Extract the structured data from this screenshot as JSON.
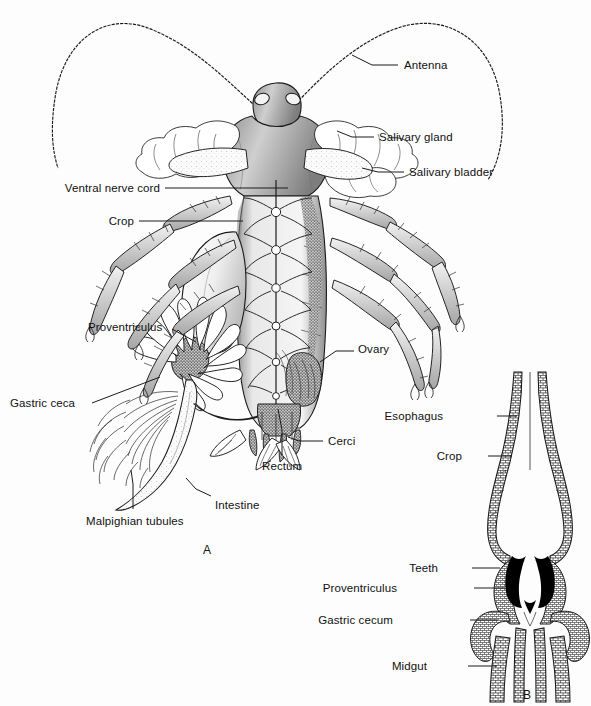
{
  "plate": {
    "background_color": "#fdfdfd",
    "ink_color": "#1a1a1a",
    "panels": [
      {
        "id": "A",
        "caption": "A",
        "x": 203,
        "y": 543
      },
      {
        "id": "B",
        "caption": "B",
        "x": 523,
        "y": 688
      }
    ]
  },
  "figure_a": {
    "name": "cockroach-internal-anatomy-dorsal-dissection",
    "labels": [
      {
        "key": "antenna",
        "text": "Antenna",
        "x": 404,
        "y": 60,
        "align": "left",
        "leader": [
          [
            398,
            65
          ],
          [
            372,
            65
          ],
          [
            352,
            55
          ]
        ]
      },
      {
        "key": "salivary_gland",
        "text": "Salivary gland",
        "x": 379,
        "y": 132,
        "align": "left",
        "leader": [
          [
            374,
            137
          ],
          [
            352,
            137
          ],
          [
            337,
            131
          ]
        ]
      },
      {
        "key": "salivary_bladder",
        "text": "Salivary bladder",
        "x": 409,
        "y": 167,
        "align": "left",
        "leader": [
          [
            404,
            172
          ],
          [
            378,
            172
          ],
          [
            362,
            168
          ]
        ]
      },
      {
        "key": "ventral_nerve_cord",
        "text": "Ventral nerve cord",
        "x": 160,
        "y": 183,
        "align": "right",
        "leader": [
          [
            165,
            188
          ],
          [
            288,
            188
          ]
        ]
      },
      {
        "key": "crop",
        "text": "Crop",
        "x": 134,
        "y": 216,
        "align": "right",
        "leader": [
          [
            139,
            221
          ],
          [
            243,
            221
          ]
        ]
      },
      {
        "key": "proventriculus",
        "text": "Proventriculus",
        "x": 88,
        "y": 322,
        "align": "left",
        "leader": [
          [
            172,
            329
          ],
          [
            196,
            342
          ]
        ]
      },
      {
        "key": "gastric_ceca",
        "text": "Gastric ceca",
        "x": 10,
        "y": 398,
        "align": "left",
        "leader": [
          [
            92,
            403
          ],
          [
            160,
            377
          ]
        ]
      },
      {
        "key": "ovary",
        "text": "Ovary",
        "x": 358,
        "y": 344,
        "align": "left",
        "leader": [
          [
            354,
            351
          ],
          [
            336,
            351
          ],
          [
            320,
            362
          ]
        ]
      },
      {
        "key": "cerci",
        "text": "Cerci",
        "x": 328,
        "y": 436,
        "align": "left",
        "leader": [
          [
            323,
            441
          ],
          [
            299,
            441
          ],
          [
            288,
            437
          ]
        ]
      },
      {
        "key": "rectum",
        "text": "Rectum",
        "x": 262,
        "y": 461,
        "align": "left",
        "leader": [
          [
            282,
            455
          ],
          [
            282,
            430
          ],
          [
            278,
            409
          ]
        ]
      },
      {
        "key": "intestine",
        "text": "Intestine",
        "x": 215,
        "y": 500,
        "align": "left",
        "leader": [
          [
            211,
            496
          ],
          [
            196,
            489
          ],
          [
            186,
            478
          ]
        ]
      },
      {
        "key": "malpighian_tubules",
        "text": "Malpighian tubules",
        "x": 86,
        "y": 516,
        "align": "left",
        "leader": [
          [
            133,
            509
          ],
          [
            133,
            484
          ],
          [
            131,
            470
          ]
        ]
      }
    ]
  },
  "figure_b": {
    "name": "proventriculus-longitudinal-section",
    "labels": [
      {
        "key": "esophagus",
        "text": "Esophagus",
        "x": 443,
        "y": 411,
        "align": "right",
        "leader": [
          [
            497,
            416
          ],
          [
            517,
            416
          ]
        ]
      },
      {
        "key": "crop_b",
        "text": "Crop",
        "x": 462,
        "y": 451,
        "align": "right",
        "leader": [
          [
            488,
            456
          ],
          [
            512,
            456
          ]
        ]
      },
      {
        "key": "teeth",
        "text": "Teeth",
        "x": 438,
        "y": 563,
        "align": "right",
        "leader": [
          [
            472,
            568
          ],
          [
            500,
            568
          ]
        ]
      },
      {
        "key": "proventriculus_b",
        "text": "Proventriculus",
        "x": 397,
        "y": 583,
        "align": "right",
        "leader": [
          [
            474,
            588
          ],
          [
            505,
            588
          ]
        ]
      },
      {
        "key": "gastric_cecum",
        "text": "Gastric cecum",
        "x": 393,
        "y": 615,
        "align": "right",
        "leader": [
          [
            470,
            620
          ],
          [
            498,
            620
          ]
        ]
      },
      {
        "key": "midgut",
        "text": "Midgut",
        "x": 427,
        "y": 661,
        "align": "right",
        "leader": [
          [
            468,
            666
          ],
          [
            497,
            666
          ]
        ]
      }
    ]
  }
}
